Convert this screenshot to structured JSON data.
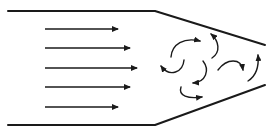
{
  "diagram": {
    "type": "flow-diagram",
    "colors": {
      "background": "#ffffff",
      "stroke": "#1a1a1a"
    },
    "duct": {
      "top_wall": [
        [
          8,
          11
        ],
        [
          155,
          11
        ],
        [
          265,
          45
        ]
      ],
      "bottom_wall": [
        [
          8,
          125
        ],
        [
          155,
          125
        ],
        [
          265,
          85
        ]
      ]
    },
    "laminar_arrows": [
      {
        "x1": 45,
        "y": 29,
        "x2": 118
      },
      {
        "x1": 45,
        "y": 48,
        "x2": 130
      },
      {
        "x1": 45,
        "y": 68,
        "x2": 137
      },
      {
        "x1": 45,
        "y": 87,
        "x2": 130
      },
      {
        "x1": 45,
        "y": 107,
        "x2": 118
      }
    ],
    "turbulent_eddies": [
      {
        "path": "M171,55 C175,42 188,36 200,41",
        "label": "eddy-1"
      },
      {
        "path": "M183,60 C181,70 173,76 162,67",
        "label": "eddy-2"
      },
      {
        "path": "M212,72 C218,86 210,90 193,82",
        "label": "eddy-3"
      },
      {
        "path": "M212,59 C222,52 218,40 211,34",
        "label": "eddy-4"
      },
      {
        "path": "M200,88 C196,97 206,101 202,98",
        "label": "eddy-5"
      },
      {
        "path": "M219,69 C226,60 240,58 246,69",
        "label": "eddy-6"
      },
      {
        "path": "M246,81 C256,76 258,65 257,55",
        "label": "eddy-7"
      }
    ]
  }
}
